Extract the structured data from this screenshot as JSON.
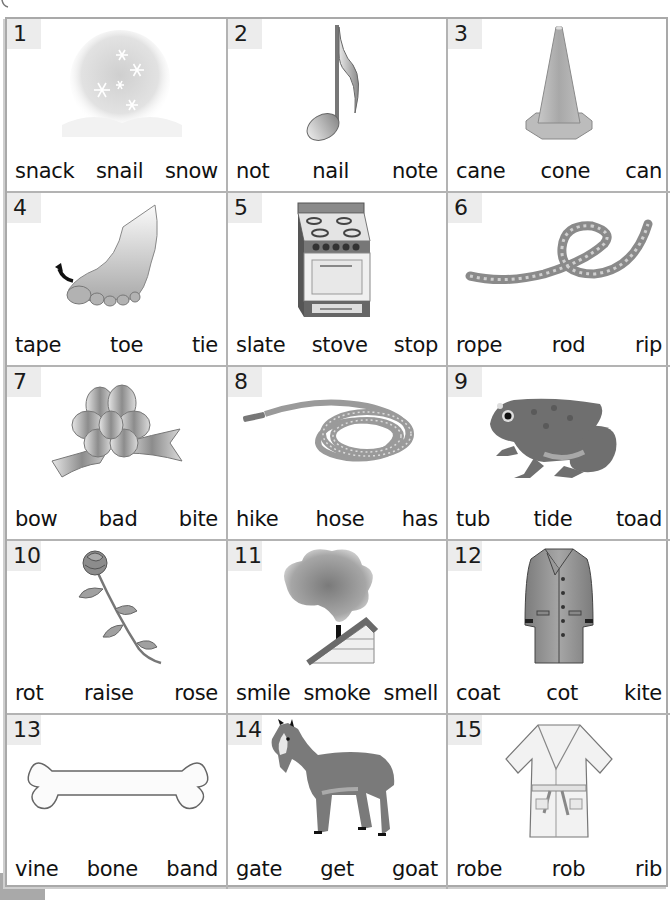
{
  "worksheet": {
    "items": [
      {
        "number": "1",
        "picture": "snow",
        "icon": "snowflakes-icon",
        "choices": [
          "snack",
          "snail",
          "snow"
        ]
      },
      {
        "number": "2",
        "picture": "note",
        "icon": "music-note-icon",
        "choices": [
          "not",
          "nail",
          "note"
        ]
      },
      {
        "number": "3",
        "picture": "cone",
        "icon": "traffic-cone-icon",
        "choices": [
          "cane",
          "cone",
          "can"
        ]
      },
      {
        "number": "4",
        "picture": "toe",
        "icon": "foot-toe-icon",
        "choices": [
          "tape",
          "toe",
          "tie"
        ]
      },
      {
        "number": "5",
        "picture": "stove",
        "icon": "stove-icon",
        "choices": [
          "slate",
          "stove",
          "stop"
        ]
      },
      {
        "number": "6",
        "picture": "rope",
        "icon": "rope-icon",
        "choices": [
          "rope",
          "rod",
          "rip"
        ]
      },
      {
        "number": "7",
        "picture": "bow",
        "icon": "ribbon-bow-icon",
        "choices": [
          "bow",
          "bad",
          "bite"
        ]
      },
      {
        "number": "8",
        "picture": "hose",
        "icon": "garden-hose-icon",
        "choices": [
          "hike",
          "hose",
          "has"
        ]
      },
      {
        "number": "9",
        "picture": "toad",
        "icon": "toad-icon",
        "choices": [
          "tub",
          "tide",
          "toad"
        ]
      },
      {
        "number": "10",
        "picture": "rose",
        "icon": "rose-icon",
        "choices": [
          "rot",
          "raise",
          "rose"
        ]
      },
      {
        "number": "11",
        "picture": "smoke",
        "icon": "chimney-smoke-icon",
        "choices": [
          "smile",
          "smoke",
          "smell"
        ]
      },
      {
        "number": "12",
        "picture": "coat",
        "icon": "coat-icon",
        "choices": [
          "coat",
          "cot",
          "kite"
        ]
      },
      {
        "number": "13",
        "picture": "bone",
        "icon": "bone-icon",
        "choices": [
          "vine",
          "bone",
          "band"
        ]
      },
      {
        "number": "14",
        "picture": "goat",
        "icon": "goat-icon",
        "choices": [
          "gate",
          "get",
          "goat"
        ]
      },
      {
        "number": "15",
        "picture": "robe",
        "icon": "bathrobe-icon",
        "choices": [
          "robe",
          "rob",
          "rib"
        ]
      }
    ]
  },
  "colors": {
    "grid_line": "#b3b3b3",
    "number_badge_bg": "#ececec",
    "text": "#111111",
    "corner_block": "#a9a9a9"
  }
}
